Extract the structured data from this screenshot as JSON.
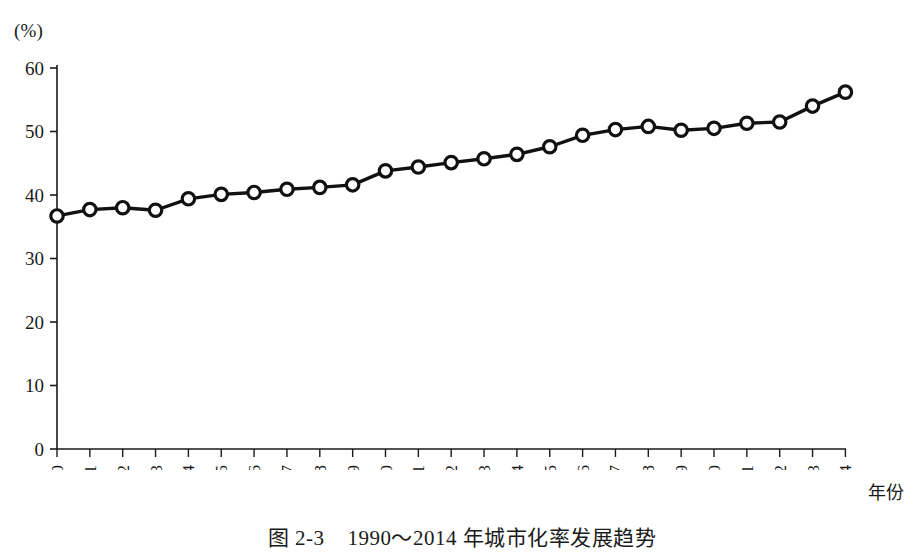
{
  "figure": {
    "unit_label": "(%)",
    "xaxis_title": "年份",
    "caption": "图 2-3    1990～2014 年城市化率发展趋势"
  },
  "chart_data": {
    "type": "line",
    "title": "图 2-3    1990～2014 年城市化率发展趋势",
    "xlabel": "年份",
    "ylabel": "(%)",
    "ylim": [
      0,
      60
    ],
    "yticks": [
      0,
      10,
      20,
      30,
      40,
      50,
      60
    ],
    "grid": false,
    "legend": "none",
    "marker": "open-circle",
    "categories": [
      "1990",
      "1991",
      "1992",
      "1993",
      "1994",
      "1995",
      "1996",
      "1997",
      "1998",
      "1999",
      "2000",
      "2001",
      "2002",
      "2003",
      "2004",
      "2005",
      "2006",
      "2007",
      "2008",
      "2009",
      "2010",
      "2011",
      "2012",
      "2013",
      "2014"
    ],
    "x": [
      1990,
      1991,
      1992,
      1993,
      1994,
      1995,
      1996,
      1997,
      1998,
      1999,
      2000,
      2001,
      2002,
      2003,
      2004,
      2005,
      2006,
      2007,
      2008,
      2009,
      2010,
      2011,
      2012,
      2013,
      2014
    ],
    "values": [
      36.7,
      37.7,
      38.0,
      37.6,
      39.4,
      40.1,
      40.4,
      40.9,
      41.2,
      41.6,
      43.8,
      44.4,
      45.1,
      45.7,
      46.4,
      47.6,
      49.4,
      50.3,
      50.8,
      50.2,
      50.5,
      51.3,
      51.5,
      54.0,
      56.2
    ],
    "annotations": []
  }
}
